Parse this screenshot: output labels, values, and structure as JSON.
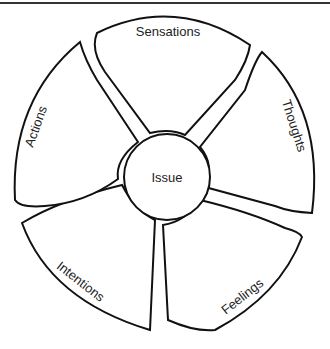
{
  "diagram": {
    "center": {
      "label": "Issue"
    },
    "segments": [
      {
        "label": "Sensations"
      },
      {
        "label": "Thoughts"
      },
      {
        "label": "Feelings"
      },
      {
        "label": "Intentions"
      },
      {
        "label": "Actions"
      }
    ]
  }
}
